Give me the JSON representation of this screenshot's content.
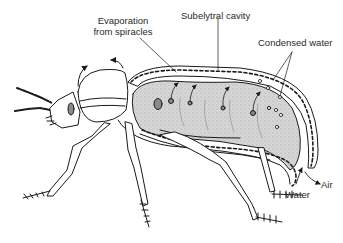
{
  "diagram": {
    "labels": {
      "evaporation_line1": "Evaporation",
      "evaporation_line2": "from spiracles",
      "subelytral": "Subelytral cavity",
      "condensed": "Condensed water",
      "air": "Air",
      "water": "Water"
    },
    "colors": {
      "line": "#1a1a1a",
      "abdomen_fill": "#d4d4d4",
      "abdomen_stipple": "#9a9a9a",
      "spiracle_fill": "#8a8a8a",
      "background": "#ffffff"
    }
  }
}
